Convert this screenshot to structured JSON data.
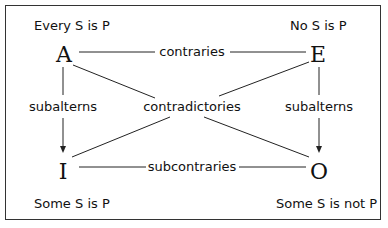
{
  "corners": {
    "A": {
      "letter": "A",
      "proposition": "Every S is P"
    },
    "E": {
      "letter": "E",
      "proposition": "No S is P"
    },
    "I": {
      "letter": "I",
      "proposition": "Some S is P"
    },
    "O": {
      "letter": "O",
      "proposition": "Some S is not P"
    }
  },
  "relations": {
    "top": "contraries",
    "diagonal": "contradictories",
    "left": "subalterns",
    "right": "subalterns",
    "bottom": "subcontraries"
  }
}
